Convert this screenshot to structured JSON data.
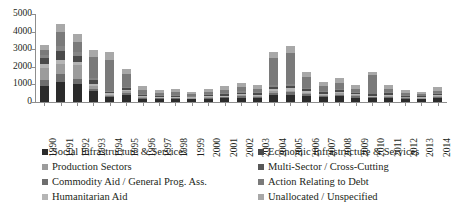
{
  "chart_data": {
    "type": "bar",
    "stacked": true,
    "title": "",
    "xlabel": "",
    "ylabel": "",
    "ylim": [
      0,
      5000
    ],
    "ytick_values": [
      0,
      1000,
      2000,
      3000,
      4000,
      5000
    ],
    "ytick_labels": [
      "0",
      "1000",
      "2000",
      "3000",
      "4000",
      "5000"
    ],
    "grid": false,
    "legend_position": "bottom",
    "categories": [
      "1990",
      "1991",
      "1992",
      "1993",
      "1994",
      "1995",
      "1996",
      "1997",
      "1998",
      "1999",
      "2000",
      "2001",
      "2002",
      "2003",
      "2004",
      "2005",
      "2006",
      "2007",
      "2008",
      "2009",
      "2010",
      "2011",
      "2012",
      "2013",
      "2014"
    ],
    "series": [
      {
        "name": "Social Infrastructure & Services",
        "color": "#2b2b2b",
        "values": [
          900,
          1150,
          1000,
          620,
          290,
          420,
          180,
          170,
          170,
          150,
          180,
          200,
          240,
          230,
          400,
          420,
          330,
          260,
          330,
          250,
          200,
          230,
          170,
          150,
          230
        ]
      },
      {
        "name": "Production Sectors",
        "color": "#6e6e6e",
        "values": [
          330,
          470,
          300,
          140,
          70,
          120,
          60,
          50,
          50,
          40,
          50,
          60,
          80,
          70,
          120,
          130,
          100,
          80,
          90,
          70,
          60,
          70,
          50,
          45,
          65
        ]
      },
      {
        "name": "Commodity Aid / General Prog. Ass.",
        "color": "#9c9c9c",
        "values": [
          720,
          520,
          800,
          160,
          60,
          60,
          40,
          35,
          35,
          30,
          40,
          50,
          60,
          55,
          90,
          100,
          80,
          60,
          70,
          55,
          45,
          55,
          40,
          35,
          50
        ]
      },
      {
        "name": "Humanitarian Aid",
        "color": "#b5b5b5",
        "values": [
          200,
          240,
          180,
          120,
          70,
          80,
          50,
          45,
          45,
          40,
          50,
          60,
          70,
          65,
          110,
          120,
          90,
          70,
          80,
          65,
          55,
          65,
          45,
          40,
          55
        ]
      },
      {
        "name": "Economic Infrastructure & Services",
        "color": "#4a4a4a",
        "values": [
          340,
          520,
          360,
          190,
          95,
          110,
          70,
          60,
          60,
          50,
          65,
          75,
          90,
          85,
          140,
          150,
          115,
          90,
          100,
          80,
          70,
          80,
          60,
          50,
          70
        ]
      },
      {
        "name": "Multi-Sector / Cross-Cutting",
        "color": "#858585",
        "values": [
          180,
          300,
          220,
          130,
          70,
          80,
          50,
          45,
          45,
          40,
          50,
          55,
          70,
          65,
          105,
          115,
          90,
          70,
          80,
          60,
          55,
          60,
          45,
          40,
          55
        ]
      },
      {
        "name": "Action Relating to Debt",
        "color": "#7a7a7a",
        "values": [
          290,
          790,
          560,
          1180,
          1760,
          700,
          260,
          110,
          150,
          90,
          140,
          200,
          240,
          180,
          1530,
          1770,
          620,
          260,
          350,
          160,
          1040,
          190,
          120,
          70,
          130
        ]
      },
      {
        "name": "Unallocated / Unspecified",
        "color": "#a8a8a8",
        "values": [
          280,
          460,
          440,
          430,
          410,
          320,
          180,
          160,
          160,
          150,
          170,
          200,
          220,
          210,
          330,
          370,
          290,
          240,
          280,
          220,
          200,
          220,
          180,
          160,
          220
        ]
      }
    ]
  },
  "legend": {
    "left_column": [
      {
        "label": "Social Infrastructure & Services",
        "color": "#2b2b2b"
      },
      {
        "label": "Production Sectors",
        "color": "#9c9c9c"
      },
      {
        "label": "Commodity Aid / General Prog. Ass.",
        "color": "#6e6e6e"
      },
      {
        "label": "Humanitarian Aid",
        "color": "#b5b5b5"
      }
    ],
    "right_column": [
      {
        "label": "Economic Infrastructure & Services",
        "color": "#4a4a4a"
      },
      {
        "label": "Multi-Sector / Cross-Cutting",
        "color": "#585858"
      },
      {
        "label": "Action Relating to Debt",
        "color": "#7a7a7a"
      },
      {
        "label": "Unallocated / Unspecified",
        "color": "#a8a8a8"
      }
    ]
  }
}
